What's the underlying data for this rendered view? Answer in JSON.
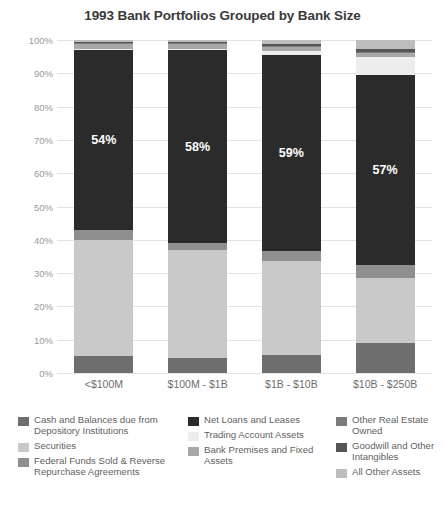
{
  "chart_data": {
    "type": "bar",
    "subtype": "stacked-100-percent",
    "title": "1993 Bank Portfolios Grouped by Bank Size",
    "xlabel": "",
    "ylabel": "",
    "ylim": [
      0,
      100
    ],
    "ytick_labels": [
      "100%",
      "90%",
      "80%",
      "70%",
      "60%",
      "50%",
      "40%",
      "30%",
      "20%",
      "10%",
      "0%"
    ],
    "ytick_values": [
      100,
      90,
      80,
      70,
      60,
      50,
      40,
      30,
      20,
      10,
      0
    ],
    "grid": true,
    "legend_position": "bottom",
    "categories": [
      "<$100M",
      "$100M - $1B",
      "$1B - $10B",
      "$10B - $250B"
    ],
    "series": [
      {
        "name": "Cash and Balances due from Depository Institutions",
        "color": "#6e6e6e",
        "values": [
          5.0,
          4.5,
          5.5,
          9.0
        ]
      },
      {
        "name": "Securities",
        "color": "#c9c9c9",
        "values": [
          35.0,
          32.5,
          28.0,
          19.5
        ]
      },
      {
        "name": "Federal Funds Sold & Reverse Repurchase Agreements",
        "color": "#8f8f8f",
        "values": [
          3.0,
          2.0,
          3.0,
          4.0
        ]
      },
      {
        "name": "Net Loans and Leases",
        "color": "#2b2b2b",
        "values": [
          54.0,
          58.0,
          59.0,
          57.0
        ]
      },
      {
        "name": "Trading Account Assets",
        "color": "#ededed",
        "values": [
          0.3,
          0.4,
          1.2,
          5.5
        ]
      },
      {
        "name": "Bank Premises and Fixed Assets",
        "color": "#a8a8a8",
        "values": [
          1.4,
          1.3,
          1.1,
          1.0
        ]
      },
      {
        "name": "Other Real Estate Owned",
        "color": "#7b7b7b",
        "values": [
          0.5,
          0.5,
          0.5,
          0.5
        ]
      },
      {
        "name": "Goodwill and Other Intangibles",
        "color": "#555555",
        "values": [
          0.2,
          0.3,
          0.5,
          0.7
        ]
      },
      {
        "name": "All Other Assets",
        "color": "#bdbdbd",
        "values": [
          0.6,
          0.5,
          1.2,
          2.8
        ]
      }
    ],
    "data_labels": [
      {
        "series": "Net Loans and Leases",
        "category": "<$100M",
        "text": "54%"
      },
      {
        "series": "Net Loans and Leases",
        "category": "$100M - $1B",
        "text": "58%"
      },
      {
        "series": "Net Loans and Leases",
        "category": "$1B - $10B",
        "text": "59%"
      },
      {
        "series": "Net Loans and Leases",
        "category": "$10B - $250B",
        "text": "57%"
      }
    ]
  },
  "legend": {
    "columns": [
      [
        {
          "label": "Cash and Balances due from Depository Institutions",
          "color": "#6e6e6e"
        },
        {
          "label": "Securities",
          "color": "#c9c9c9"
        },
        {
          "label": "Federal Funds Sold & Reverse Repurchase Agreements",
          "color": "#8f8f8f"
        }
      ],
      [
        {
          "label": "Net Loans and Leases",
          "color": "#2b2b2b"
        },
        {
          "label": "Trading Account Assets",
          "color": "#ededed"
        },
        {
          "label": "Bank Premises and Fixed Assets",
          "color": "#a8a8a8"
        }
      ],
      [
        {
          "label": "Other Real Estate Owned",
          "color": "#7b7b7b"
        },
        {
          "label": "Goodwill and Other Intangibles",
          "color": "#555555"
        },
        {
          "label": "All Other Assets",
          "color": "#bdbdbd"
        }
      ]
    ]
  },
  "colors": {
    "background": "#ffffff",
    "title": "#3a3a3a",
    "axis_text": "#9a9a9a",
    "category_text": "#6d6d6d",
    "legend_text": "#5f5f5f",
    "gridline": "#e3e3e3",
    "data_label": "#ffffff"
  }
}
